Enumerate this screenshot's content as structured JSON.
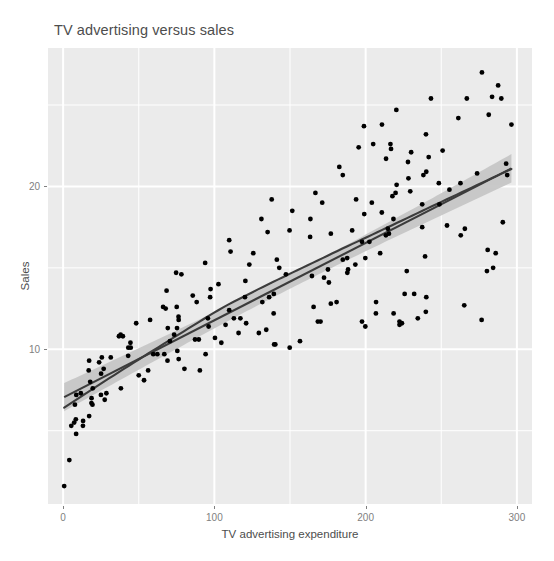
{
  "chart_data": {
    "type": "scatter",
    "title": "TV advertising versus sales",
    "xlabel": "TV advertising expenditure",
    "ylabel": "Sales",
    "xlim": [
      -10,
      310
    ],
    "ylim": [
      0.5,
      28.5
    ],
    "xticks": [
      0,
      100,
      200,
      300
    ],
    "xtick_labels": [
      "0",
      "100",
      "200",
      "300"
    ],
    "yticks": [
      10,
      20
    ],
    "ytick_labels": [
      "10",
      "20"
    ],
    "x_minor_gridlines": [
      50,
      150,
      250
    ],
    "y_minor_gridlines": [
      5,
      15,
      25
    ],
    "grid": true,
    "legend": "none",
    "panel_background": "#ebebeb",
    "gridline_color": "#ffffff",
    "point_color": "#000000",
    "point_size": 3.6,
    "trend_line_color": "#3c3c3c",
    "confidence_band_color": "#c6c6c6",
    "series": [
      {
        "name": "Sales vs TV advertising expenditure",
        "x": [
          230.1,
          44.5,
          17.2,
          151.5,
          180.8,
          8.7,
          57.5,
          120.2,
          8.6,
          199.8,
          66.1,
          214.7,
          23.8,
          97.5,
          204.1,
          195.4,
          67.8,
          281.4,
          69.2,
          147.3,
          218.4,
          237.4,
          13.2,
          228.3,
          62.3,
          262.9,
          142.9,
          240.1,
          248.8,
          70.6,
          292.9,
          112.9,
          97.2,
          265.6,
          95.7,
          290.7,
          266.9,
          74.7,
          43.1,
          228.0,
          202.5,
          177.0,
          293.6,
          206.9,
          25.1,
          175.1,
          89.7,
          239.9,
          227.2,
          66.9,
          199.8,
          100.4,
          216.4,
          182.6,
          262.7,
          198.9,
          7.3,
          136.2,
          210.8,
          210.7,
          53.5,
          261.3,
          239.3,
          102.7,
          131.1,
          69.0,
          31.5,
          139.3,
          237.4,
          216.8,
          199.1,
          109.8,
          26.8,
          129.4,
          213.4,
          16.9,
          27.5,
          120.5,
          5.4,
          116.0,
          76.4,
          239.8,
          75.3,
          68.4,
          213.5,
          193.2,
          76.3,
          110.7,
          88.3,
          109.8,
          134.3,
          28.6,
          217.7,
          250.9,
          107.4,
          163.3,
          197.6,
          184.9,
          289.7,
          135.2,
          222.4,
          296.4,
          280.2,
          187.9,
          238.2,
          137.9,
          25.0,
          90.4,
          13.1,
          255.4,
          225.8,
          241.7,
          175.7,
          209.6,
          78.2,
          75.1,
          139.2,
          76.4,
          125.7,
          19.4,
          141.3,
          18.8,
          224.0,
          123.1,
          229.5,
          87.2,
          7.8,
          80.2,
          220.3,
          59.6,
          0.7,
          265.2,
          8.4,
          219.8,
          36.9,
          48.3,
          25.6,
          273.7,
          43.0,
          184.9,
          73.4,
          193.7,
          220.5,
          104.6,
          96.2,
          140.3,
          240.1,
          243.2,
          38.0,
          44.7,
          280.7,
          121.0,
          197.6,
          171.3,
          187.8,
          4.1,
          93.9,
          149.8,
          11.7,
          131.7,
          172.5,
          85.7,
          188.4,
          163.5,
          117.2,
          234.5,
          17.9,
          206.8,
          215.4,
          284.3,
          50.0,
          164.5,
          19.6,
          168.4,
          222.4,
          276.9,
          248.4,
          170.2,
          276.7,
          165.6,
          156.6,
          218.5,
          56.2,
          287.6,
          253.8,
          205.0,
          139.5,
          191.1,
          286.0,
          18.7,
          39.5,
          75.5,
          17.2,
          166.8,
          149.7,
          38.2,
          94.2,
          177.0,
          283.6,
          232.1
        ],
        "y": [
          22.1,
          10.4,
          9.3,
          18.5,
          12.9,
          7.2,
          11.8,
          13.2,
          4.8,
          15.6,
          12.6,
          17.4,
          9.2,
          13.7,
          19.0,
          22.4,
          12.5,
          24.4,
          11.3,
          14.6,
          18.0,
          17.5,
          5.6,
          20.5,
          9.7,
          17.0,
          15.0,
          20.9,
          18.9,
          10.5,
          21.4,
          11.9,
          13.2,
          17.4,
          11.9,
          17.8,
          25.4,
          14.7,
          10.1,
          21.5,
          16.6,
          17.1,
          20.7,
          12.9,
          8.5,
          14.9,
          10.6,
          23.2,
          14.8,
          9.7,
          11.4,
          10.7,
          22.6,
          21.2,
          20.2,
          23.7,
          5.5,
          13.2,
          23.8,
          18.4,
          8.1,
          24.2,
          15.7,
          14.0,
          18.0,
          9.3,
          9.5,
          13.4,
          18.9,
          22.3,
          18.3,
          12.4,
          8.8,
          11.0,
          17.0,
          8.7,
          6.9,
          14.2,
          5.3,
          11.0,
          11.8,
          12.3,
          11.3,
          13.6,
          21.7,
          15.2,
          12.0,
          16.0,
          12.9,
          16.7,
          11.2,
          7.3,
          19.4,
          22.2,
          11.5,
          16.9,
          11.7,
          15.5,
          25.4,
          17.2,
          11.7,
          23.8,
          14.8,
          14.7,
          20.7,
          19.2,
          7.2,
          8.7,
          5.3,
          19.8,
          13.4,
          21.8,
          14.1,
          15.9,
          14.6,
          12.6,
          12.2,
          9.4,
          15.9,
          6.6,
          15.5,
          7.0,
          11.6,
          15.2,
          19.7,
          10.6,
          6.6,
          8.8,
          24.7,
          9.7,
          1.6,
          12.7,
          5.7,
          19.6,
          10.8,
          11.6,
          9.5,
          20.8,
          9.6,
          20.7,
          10.9,
          19.2,
          20.1,
          10.4,
          11.4,
          10.3,
          13.2,
          25.4,
          10.9,
          10.1,
          16.1,
          11.6,
          16.6,
          19.0,
          15.6,
          3.2,
          15.3,
          10.1,
          7.3,
          12.9,
          14.4,
          13.3,
          14.9,
          18.0,
          11.9,
          11.9,
          8.0,
          12.2,
          17.1,
          15.0,
          8.4,
          14.5,
          7.6,
          11.7,
          11.5,
          27.0,
          20.2,
          11.7,
          11.8,
          12.6,
          10.5,
          12.2,
          8.7,
          26.2,
          17.6,
          22.6,
          10.3,
          17.3,
          15.9,
          6.7,
          10.8,
          9.9,
          5.9,
          19.6,
          17.3,
          7.6,
          9.7,
          12.8,
          25.5,
          13.4
        ],
        "n_points": 200
      }
    ],
    "fits": [
      {
        "name": "linear-regression",
        "method": "lm",
        "intercept": 7.03,
        "slope": 0.0475,
        "confidence_band": 0.95,
        "color": "#3c3c3c"
      },
      {
        "name": "loess-smooth",
        "method": "loess",
        "color": "#3c3c3c"
      }
    ]
  }
}
